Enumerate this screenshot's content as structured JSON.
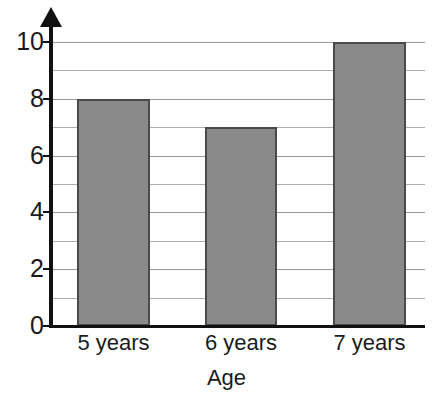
{
  "chart_data": {
    "type": "bar",
    "title": "",
    "xlabel": "Age",
    "ylabel": "",
    "categories": [
      "5 years",
      "6 years",
      "7 years"
    ],
    "values": [
      8,
      7,
      10
    ],
    "ylim": [
      0,
      10
    ],
    "ytick_labels": [
      "0",
      "2",
      "4",
      "6",
      "8",
      "10"
    ],
    "ytick_values": [
      0,
      2,
      4,
      6,
      8,
      10
    ],
    "gridline_values": [
      0,
      1,
      2,
      3,
      4,
      5,
      6,
      7,
      8,
      9,
      10
    ],
    "grid": true,
    "legend": "none",
    "bar_fill_color": "#8a8a8a",
    "bar_border_color": "#4a4a4a",
    "axis_color": "#111111",
    "gridline_color": "#aeaeae"
  }
}
